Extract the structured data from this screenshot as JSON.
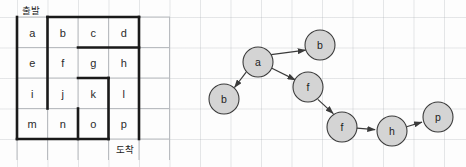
{
  "figure": {
    "background_color": "#fdfdfd",
    "wall_color": "#1a1a1a",
    "grid_color": "#b9bcc0",
    "node_fill": "#d4d4d4",
    "node_stroke": "#3b3b3b",
    "edge_color": "#3b3b3b"
  },
  "maze": {
    "label_start": "출발",
    "label_goal": "도착",
    "columns": 4,
    "rows": 4,
    "cells": [
      [
        {
          "id": "a"
        },
        {
          "id": "b"
        },
        {
          "id": "c"
        },
        {
          "id": "d"
        }
      ],
      [
        {
          "id": "e"
        },
        {
          "id": "f"
        },
        {
          "id": "g"
        },
        {
          "id": "h"
        }
      ],
      [
        {
          "id": "i"
        },
        {
          "id": "j"
        },
        {
          "id": "k"
        },
        {
          "id": "l"
        }
      ],
      [
        {
          "id": "m"
        },
        {
          "id": "n"
        },
        {
          "id": "o"
        },
        {
          "id": "p"
        }
      ]
    ],
    "cell_ids_flat": [
      "a",
      "b",
      "c",
      "d",
      "e",
      "f",
      "g",
      "h",
      "i",
      "j",
      "k",
      "l",
      "m",
      "n",
      "o",
      "p"
    ],
    "start_cell": "a",
    "goal_cell": "p"
  },
  "graph": {
    "title": "",
    "nodes": [
      {
        "id": "n1",
        "label": "a",
        "cx": 62,
        "cy": 62
      },
      {
        "id": "n2",
        "label": "b",
        "cx": 124,
        "cy": 45
      },
      {
        "id": "n3",
        "label": "b",
        "cx": 28,
        "cy": 99
      },
      {
        "id": "n4",
        "label": "f",
        "cx": 112,
        "cy": 87
      },
      {
        "id": "n5",
        "label": "f",
        "cx": 146,
        "cy": 127
      },
      {
        "id": "n6",
        "label": "h",
        "cx": 196,
        "cy": 131
      },
      {
        "id": "n7",
        "label": "p",
        "cx": 242,
        "cy": 117
      }
    ],
    "node_radius": 15,
    "edges": [
      {
        "from": "n1",
        "to": "n2",
        "directed": true
      },
      {
        "from": "n1",
        "to": "n3",
        "directed": true
      },
      {
        "from": "n1",
        "to": "n4",
        "directed": true
      },
      {
        "from": "n4",
        "to": "n5",
        "directed": true
      },
      {
        "from": "n5",
        "to": "n6",
        "directed": true
      },
      {
        "from": "n6",
        "to": "n7",
        "directed": true
      }
    ]
  }
}
